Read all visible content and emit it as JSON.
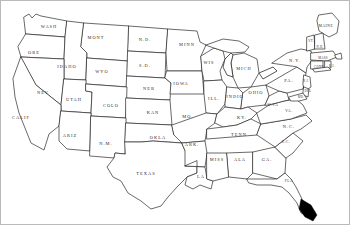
{
  "map": {
    "title": "United States outline map",
    "background_color": "#ffffff",
    "outline_color": "#2a2a2a",
    "border_color": "#b9b9b9",
    "marker": {
      "name": "black-marker-blob",
      "color": "#000000",
      "location_hint": "southern tip of Florida"
    },
    "states": [
      {
        "id": "washington",
        "label": "WASH",
        "x": 48,
        "y": 26,
        "size": "normal"
      },
      {
        "id": "oregon",
        "label": "ORE",
        "x": 33,
        "y": 52,
        "size": "normal"
      },
      {
        "id": "idaho",
        "label": "IDAHO",
        "x": 66,
        "y": 66,
        "size": "normal"
      },
      {
        "id": "montana",
        "label": "MONT",
        "x": 95,
        "y": 37,
        "size": "normal"
      },
      {
        "id": "wyoming",
        "label": "WYO",
        "x": 101,
        "y": 71,
        "size": "normal"
      },
      {
        "id": "north-dakota",
        "label": "N.D.",
        "x": 144,
        "y": 39,
        "size": "normal"
      },
      {
        "id": "south-dakota",
        "label": "S.D.",
        "x": 144,
        "y": 65,
        "size": "normal"
      },
      {
        "id": "nebraska",
        "label": "NEB",
        "x": 148,
        "y": 88,
        "size": "normal"
      },
      {
        "id": "minnesota",
        "label": "MINN",
        "x": 186,
        "y": 44,
        "size": "normal"
      },
      {
        "id": "iowa",
        "label": "IOWA",
        "x": 180,
        "y": 83,
        "size": "normal"
      },
      {
        "id": "wisconsin",
        "label": "WIS",
        "x": 208,
        "y": 62,
        "size": "normal"
      },
      {
        "id": "michigan",
        "label": "MICH",
        "x": 243,
        "y": 68,
        "size": "normal"
      },
      {
        "id": "illinois",
        "label": "ILL.",
        "x": 213,
        "y": 98,
        "size": "normal"
      },
      {
        "id": "indiana",
        "label": "INDIO",
        "x": 234,
        "y": 96,
        "size": "normal"
      },
      {
        "id": "ohio",
        "label": "OHIO",
        "x": 255,
        "y": 92,
        "size": "normal"
      },
      {
        "id": "nevada",
        "label": "NEV",
        "x": 42,
        "y": 92,
        "size": "normal"
      },
      {
        "id": "utah",
        "label": "UTAH",
        "x": 73,
        "y": 99,
        "size": "normal"
      },
      {
        "id": "colorado",
        "label": "COLO",
        "x": 110,
        "y": 105,
        "size": "normal"
      },
      {
        "id": "kansas",
        "label": "KAN",
        "x": 152,
        "y": 112,
        "size": "normal"
      },
      {
        "id": "missouri",
        "label": "MO.",
        "x": 187,
        "y": 116,
        "size": "normal"
      },
      {
        "id": "kentucky",
        "label": "KY.",
        "x": 241,
        "y": 117,
        "size": "normal"
      },
      {
        "id": "california",
        "label": "CALIF",
        "x": 20,
        "y": 117,
        "size": "normal"
      },
      {
        "id": "arizona",
        "label": "ARIZ",
        "x": 69,
        "y": 135,
        "size": "normal"
      },
      {
        "id": "new-mexico",
        "label": "N.M.",
        "x": 105,
        "y": 143,
        "size": "normal"
      },
      {
        "id": "oklahoma",
        "label": "OKLA",
        "x": 157,
        "y": 137,
        "size": "normal"
      },
      {
        "id": "arkansas",
        "label": "ARK.",
        "x": 191,
        "y": 144,
        "size": "normal"
      },
      {
        "id": "tennessee",
        "label": "TENN",
        "x": 238,
        "y": 134,
        "size": "normal"
      },
      {
        "id": "texas",
        "label": "TEXAS",
        "x": 145,
        "y": 173,
        "size": "normal"
      },
      {
        "id": "louisiana",
        "label": "LA",
        "x": 200,
        "y": 176,
        "size": "normal"
      },
      {
        "id": "mississippi",
        "label": "MISS",
        "x": 216,
        "y": 159,
        "size": "normal"
      },
      {
        "id": "alabama",
        "label": "ALA",
        "x": 239,
        "y": 159,
        "size": "normal"
      },
      {
        "id": "georgia",
        "label": "GA.",
        "x": 266,
        "y": 159,
        "size": "normal"
      },
      {
        "id": "florida",
        "label": "FLA",
        "x": 288,
        "y": 180,
        "size": "tiny"
      },
      {
        "id": "south-carolina",
        "label": "S.C.",
        "x": 285,
        "y": 141,
        "size": "tiny"
      },
      {
        "id": "north-carolina",
        "label": "N.C.",
        "x": 288,
        "y": 126,
        "size": "normal"
      },
      {
        "id": "virginia",
        "label": "VA.",
        "x": 288,
        "y": 110,
        "size": "tiny"
      },
      {
        "id": "west-virginia",
        "label": "W.VA",
        "x": 272,
        "y": 104,
        "size": "tiny"
      },
      {
        "id": "pennsylvania",
        "label": "PA.",
        "x": 288,
        "y": 80,
        "size": "normal"
      },
      {
        "id": "new-york",
        "label": "N.Y.",
        "x": 294,
        "y": 60,
        "size": "normal"
      },
      {
        "id": "maine",
        "label": "MAINE",
        "x": 325,
        "y": 25,
        "size": "tiny"
      },
      {
        "id": "vermont",
        "label": "VT.",
        "x": 310,
        "y": 40,
        "size": "mini"
      },
      {
        "id": "new-hampshire",
        "label": "N.H.",
        "x": 319,
        "y": 46,
        "size": "mini"
      },
      {
        "id": "massachusetts",
        "label": "MASS",
        "x": 322,
        "y": 57,
        "size": "mini"
      },
      {
        "id": "rhode-island",
        "label": "R.I.",
        "x": 331,
        "y": 65,
        "size": "mini"
      },
      {
        "id": "connecticut",
        "label": "CONN",
        "x": 318,
        "y": 66,
        "size": "mini"
      },
      {
        "id": "new-jersey",
        "label": "N.J.",
        "x": 305,
        "y": 80,
        "size": "mini"
      },
      {
        "id": "delaware",
        "label": "DEL",
        "x": 307,
        "y": 90,
        "size": "mini"
      },
      {
        "id": "maryland",
        "label": "MD.",
        "x": 300,
        "y": 96,
        "size": "mini"
      }
    ]
  }
}
